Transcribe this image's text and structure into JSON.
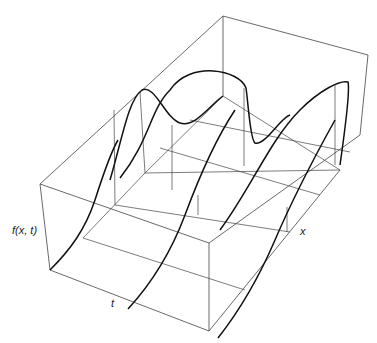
{
  "figure": {
    "type": "3d-wireframe-surface",
    "axis_labels": {
      "vertical": "f(x, t)",
      "depth": "t",
      "horizontal": "x"
    },
    "caption_fragment": ""
  },
  "colors": {
    "frame": "#444444",
    "curve": "#111111",
    "label": "#222222"
  }
}
